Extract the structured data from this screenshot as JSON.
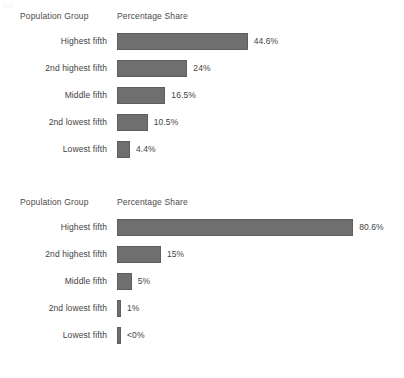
{
  "page": {
    "background_color": "#ffffff",
    "text_color": "#3f3f3f",
    "bar_color": "#6f6f6f",
    "bar_border_color": "#5e5e5e"
  },
  "charts": [
    {
      "id": "chart-1",
      "headers": {
        "group": "Population Group",
        "share": "Percentage Share"
      },
      "rows": [
        {
          "label": "Highest fifth",
          "value_label": "44.6%",
          "value": 44.6
        },
        {
          "label": "2nd highest fifth",
          "value_label": "24%",
          "value": 24
        },
        {
          "label": "Middle fifth",
          "value_label": "16.5%",
          "value": 16.5
        },
        {
          "label": "2nd lowest fifth",
          "value_label": "10.5%",
          "value": 10.5
        },
        {
          "label": "Lowest fifth",
          "value_label": "4.4%",
          "value": 4.4
        }
      ]
    },
    {
      "id": "chart-2",
      "headers": {
        "group": "Population Group",
        "share": "Percentage Share"
      },
      "rows": [
        {
          "label": "Highest fifth",
          "value_label": "80.6%",
          "value": 80.6
        },
        {
          "label": "2nd highest fifth",
          "value_label": "15%",
          "value": 15
        },
        {
          "label": "Middle fifth",
          "value_label": "5%",
          "value": 5
        },
        {
          "label": "2nd lowest fifth",
          "value_label": "1%",
          "value": 1
        },
        {
          "label": "Lowest fifth",
          "value_label": "<0%",
          "value": 0
        }
      ]
    }
  ],
  "chart_data": [
    {
      "type": "bar",
      "orientation": "horizontal",
      "title": "",
      "xlabel": "Percentage Share",
      "ylabel": "Population Group",
      "categories": [
        "Highest fifth",
        "2nd highest fifth",
        "Middle fifth",
        "2nd lowest fifth",
        "Lowest fifth"
      ],
      "values": [
        44.6,
        24,
        16.5,
        10.5,
        4.4
      ],
      "data_labels": [
        "44.6%",
        "24%",
        "16.5%",
        "10.5%",
        "4.4%"
      ],
      "xlim": [
        0,
        100
      ],
      "grid": false,
      "legend": "none",
      "bar_color": "#6f6f6f"
    },
    {
      "type": "bar",
      "orientation": "horizontal",
      "title": "",
      "xlabel": "Percentage Share",
      "ylabel": "Population Group",
      "categories": [
        "Highest fifth",
        "2nd highest fifth",
        "Middle fifth",
        "2nd lowest fifth",
        "Lowest fifth"
      ],
      "values": [
        80.6,
        15,
        5,
        1,
        0
      ],
      "data_labels": [
        "80.6%",
        "15%",
        "5%",
        "1%",
        "<0%"
      ],
      "xlim": [
        0,
        100
      ],
      "grid": false,
      "legend": "none",
      "bar_color": "#6f6f6f"
    }
  ]
}
